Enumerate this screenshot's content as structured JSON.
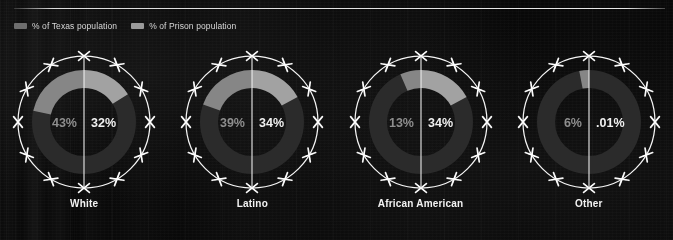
{
  "legend": {
    "items": [
      {
        "label": "% of Texas population",
        "color": "#6e6e6e",
        "icon": "legend-swatch"
      },
      {
        "label": "% of Prison population",
        "color": "#9a9a9a",
        "icon": "legend-swatch"
      }
    ]
  },
  "colors": {
    "background": "#0a0a0a",
    "arc_fill": "#a9a9a9",
    "arc_track": "#2b2b2b",
    "wire": "#f5f5f5",
    "divider": "#ededed",
    "text_left": "#8e8e8e",
    "text_right": "#f0f0f0",
    "label": "#f2f2f2"
  },
  "chart_data": {
    "type": "pie",
    "title": "",
    "subtitle": "",
    "xlabel": "",
    "ylabel": "",
    "legend_position": "top-left",
    "grid": false,
    "categories": [
      "White",
      "Latino",
      "African American",
      "Other"
    ],
    "series": [
      {
        "name": "% of Texas population",
        "values": [
          43,
          39,
          13,
          6
        ],
        "color": "#6e6e6e"
      },
      {
        "name": "% of Prison population",
        "values": [
          32,
          34,
          34,
          0.01
        ],
        "color": "#9a9a9a"
      }
    ],
    "charts": [
      {
        "category": "White",
        "left": {
          "series": "% of Texas population",
          "value": 43,
          "display": "43%"
        },
        "right": {
          "series": "% of Prison population",
          "value": 32,
          "display": "32%"
        }
      },
      {
        "category": "Latino",
        "left": {
          "series": "% of Texas population",
          "value": 39,
          "display": "39%"
        },
        "right": {
          "series": "% of Prison population",
          "value": 34,
          "display": "34%"
        }
      },
      {
        "category": "African American",
        "left": {
          "series": "% of Texas population",
          "value": 13,
          "display": "13%"
        },
        "right": {
          "series": "% of Prison population",
          "value": 34,
          "display": "34%"
        }
      },
      {
        "category": "Other",
        "left": {
          "series": "% of Texas population",
          "value": 6,
          "display": "6%"
        },
        "right": {
          "series": "% of Prison population",
          "value": 0.01,
          "display": ".01%"
        }
      }
    ]
  }
}
